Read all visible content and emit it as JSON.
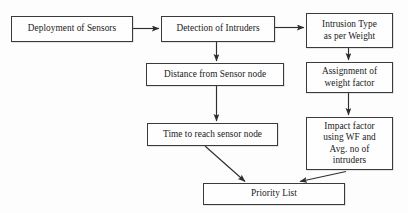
{
  "diagram": {
    "background_color": "#fdfdfd",
    "line_color": "#2e2e2e",
    "text_color": "#1a1a1a",
    "nodes": [
      {
        "id": "deployment",
        "label": "Deployment of Sensors"
      },
      {
        "id": "detection",
        "label": "Detection of Intruders"
      },
      {
        "id": "intrusion",
        "label": "Intrusion Type\nas per Weight"
      },
      {
        "id": "distance",
        "label": "Distance from Sensor node"
      },
      {
        "id": "assignment",
        "label": "Assignment of\nweight factor"
      },
      {
        "id": "time",
        "label": "Time to reach sensor node"
      },
      {
        "id": "impact",
        "label": "Impact factor\nusing WF and\nAvg. no of\nintruders"
      },
      {
        "id": "priority",
        "label": "Priority List"
      }
    ],
    "edges": [
      {
        "from": "deployment",
        "to": "detection",
        "style": "horizontal-arrow"
      },
      {
        "from": "detection",
        "to": "intrusion",
        "style": "horizontal-arrow"
      },
      {
        "from": "detection",
        "to": "distance",
        "style": "vertical-arrow"
      },
      {
        "from": "distance",
        "to": "time",
        "style": "vertical-arrow"
      },
      {
        "from": "intrusion",
        "to": "assignment",
        "style": "vertical-arrow"
      },
      {
        "from": "assignment",
        "to": "impact",
        "style": "vertical-arrow"
      },
      {
        "from": "time",
        "to": "priority",
        "style": "diagonal-arrow"
      },
      {
        "from": "impact",
        "to": "priority",
        "style": "diagonal-arrow"
      }
    ]
  }
}
